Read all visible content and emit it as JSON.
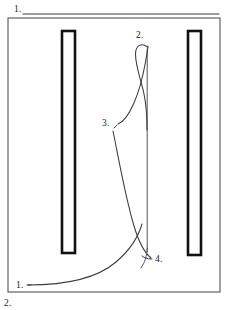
{
  "figure": {
    "background_color": "#ffffff",
    "line_color": "#3a3a42",
    "frame_color": "#555555",
    "bar_color": "#111111",
    "text_color": "#1a1a1a",
    "width": 227,
    "height": 310
  },
  "callouts": {
    "top_left": {
      "label": "1.",
      "x": 14,
      "y": 12,
      "leader_from_x": 23,
      "leader_from_y": 14,
      "leader_to_x": 220,
      "leader_to_y": 14
    },
    "loop_top": {
      "label": "2.",
      "x": 136,
      "y": 38
    },
    "curve_bend": {
      "label": "3.",
      "x": 104,
      "y": 126
    },
    "curve_cross": {
      "label": "4.",
      "x": 156,
      "y": 261
    },
    "bottom_left_inside": {
      "label": "1.",
      "x": 16,
      "y": 286
    },
    "bottom_outside": {
      "label": "2.",
      "x": 4,
      "y": 306
    }
  },
  "frame": {
    "name": "outer-frame",
    "x": 8,
    "y": 18,
    "width": 212,
    "height": 274
  },
  "bars": [
    {
      "name": "left-bar",
      "x": 62,
      "y": 31,
      "width": 13,
      "height": 222
    },
    {
      "name": "right-bar",
      "x": 188,
      "y": 31,
      "width": 13,
      "height": 224
    }
  ],
  "paths": {
    "hairpin_loop": "M 147.5 47 C 141 42 135.5 46 135.5 54 C 135.5 66 141 80 144 94 C 147 108 147 118 147 130",
    "s_curve": "M 118 124 C 124 122 129 114 133.5 104 C 139 92 143 76 145.5 62 C 147 53 148 48 148 46",
    "main_long_curve": "M 113 131 C 118 155 125 196 134 226 C 140 246 146 254 151 258",
    "bottom_sweep": "M 28 285 C 60 285 95 280 116 262 C 130 250 138 238 142 224",
    "vertical_line": "M 147.2 49 L 147.2 252",
    "vertical_tail": "M 147.2 248 C 147 256 145 262 141 268",
    "leader_4": "M 152 259 L 151 259 C 148 259 144.5 258 142 256",
    "leader_3_tick": "M 114 128 L 117 125",
    "leader_top_1": "M 23 14 L 219 14",
    "leader_bottom_1": "M 27 285 L 31 285"
  }
}
